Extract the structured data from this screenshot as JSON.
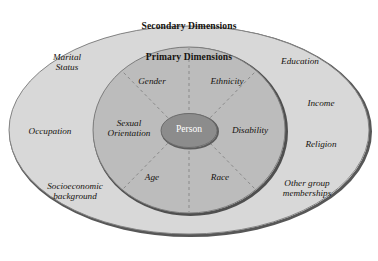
{
  "diagram": {
    "name": "diversity-wheel",
    "colors": {
      "page_background": "#ffffff",
      "outer_ring_fill": "#d8d8d8",
      "middle_ring_fill": "#bcbcbc",
      "center_fill": "#8c8c8c",
      "outline": "#7a7a7a",
      "shadow_outline": "#555555",
      "spoke_line": "#8d8d8d",
      "text": "#16130f",
      "center_text": "#ffffff"
    },
    "outer_ring": {
      "title": "Secondary Dimensions",
      "labels": [
        {
          "text": "Marital\nStatus"
        },
        {
          "text": "Education"
        },
        {
          "text": "Occupation"
        },
        {
          "text": "Income"
        },
        {
          "text": "Religion"
        },
        {
          "text": "Socioeconomic\nbackground"
        },
        {
          "text": "Other group\nmemberships"
        }
      ]
    },
    "middle_ring": {
      "title": "Primary Dimensions",
      "labels": [
        {
          "text": "Gender"
        },
        {
          "text": "Ethnicity"
        },
        {
          "text": "Sexual\nOrientation"
        },
        {
          "text": "Disability"
        },
        {
          "text": "Age"
        },
        {
          "text": "Race"
        }
      ]
    },
    "center": {
      "label": "Person"
    }
  }
}
